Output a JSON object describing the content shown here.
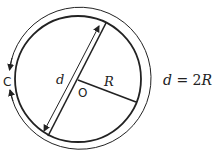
{
  "diagram": {
    "labels": {
      "circumference": "C",
      "diameter": "d",
      "radius": "R",
      "center": "O"
    },
    "formula": {
      "lhs": "d",
      "op": "=",
      "coef": "2",
      "var": "R"
    },
    "colors": {
      "stroke": "#222222",
      "background": "#ffffff"
    }
  }
}
